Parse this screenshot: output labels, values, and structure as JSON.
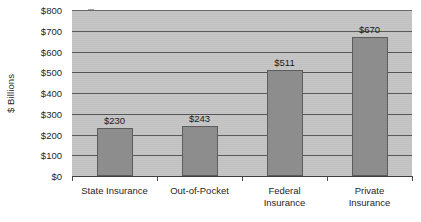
{
  "chart_data": {
    "type": "bar",
    "title": "",
    "subtitle": "",
    "xlabel": "",
    "ylabel": "$ Billions",
    "categories": [
      "State Insurance",
      "Out-of-Pocket",
      "Federal Insurance",
      "Private Insurance"
    ],
    "category_lines": [
      [
        "State Insurance"
      ],
      [
        "Out-of-Pocket"
      ],
      [
        "Federal",
        "Insurance"
      ],
      [
        "Private",
        "Insurance"
      ]
    ],
    "values": [
      230,
      243,
      511,
      670
    ],
    "data_labels": [
      "$230",
      "$243",
      "$511",
      "$670"
    ],
    "ylim": [
      0,
      800
    ],
    "ytick_values": [
      0,
      100,
      200,
      300,
      400,
      500,
      600,
      700,
      800
    ],
    "ytick_labels": [
      "$0",
      "$100",
      "$200",
      "$300",
      "$400",
      "$500",
      "$600",
      "$700",
      "$800"
    ],
    "grid": true,
    "grid_axis": "y",
    "legend": false,
    "legend_position": "none",
    "colors": {
      "bar_fill": "#8d8d8d",
      "bar_border": "#5c5c5c",
      "plot_background": "#c4c4c4",
      "gridline": "#555555",
      "axis": "#3f3f3f",
      "text": "#1f1f1f",
      "page_background": "#ffffff"
    }
  }
}
